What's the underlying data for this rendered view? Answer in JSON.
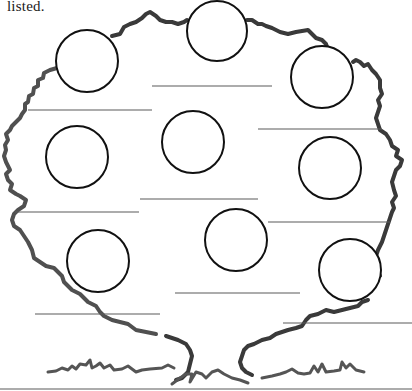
{
  "page": {
    "caption": "listed."
  },
  "tree": {
    "name": "family-tree-worksheet",
    "outline_color": "#505050",
    "circle_color": "#111111",
    "line_color": "#5a5a5a",
    "circles": [
      {
        "id": 1,
        "cx": 87,
        "cy": 61,
        "r": 31
      },
      {
        "id": 2,
        "cx": 217,
        "cy": 31,
        "r": 30
      },
      {
        "id": 3,
        "cx": 322,
        "cy": 77,
        "r": 31
      },
      {
        "id": 4,
        "cx": 77,
        "cy": 157,
        "r": 31
      },
      {
        "id": 5,
        "cx": 193,
        "cy": 142,
        "r": 31
      },
      {
        "id": 6,
        "cx": 330,
        "cy": 168,
        "r": 31
      },
      {
        "id": 7,
        "cx": 98,
        "cy": 261,
        "r": 31
      },
      {
        "id": 8,
        "cx": 236,
        "cy": 240,
        "r": 31
      },
      {
        "id": 9,
        "cx": 350,
        "cy": 270,
        "r": 31
      }
    ],
    "answer_lines": [
      {
        "id": 1,
        "x1": 152,
        "y1": 86,
        "x2": 272,
        "y2": 86
      },
      {
        "id": 2,
        "x1": 28,
        "y1": 110,
        "x2": 152,
        "y2": 110
      },
      {
        "id": 3,
        "x1": 258,
        "y1": 129,
        "x2": 382,
        "y2": 129
      },
      {
        "id": 4,
        "x1": 140,
        "y1": 199,
        "x2": 258,
        "y2": 199
      },
      {
        "id": 5,
        "x1": 15,
        "y1": 212,
        "x2": 139,
        "y2": 212
      },
      {
        "id": 6,
        "x1": 268,
        "y1": 222,
        "x2": 390,
        "y2": 222
      },
      {
        "id": 7,
        "x1": 175,
        "y1": 293,
        "x2": 300,
        "y2": 293
      },
      {
        "id": 8,
        "x1": 35,
        "y1": 314,
        "x2": 160,
        "y2": 314
      },
      {
        "id": 9,
        "x1": 283,
        "y1": 323,
        "x2": 412,
        "y2": 323
      }
    ]
  }
}
